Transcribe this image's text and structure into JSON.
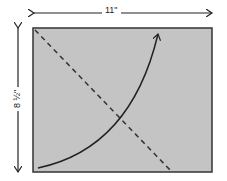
{
  "diagram": {
    "width_label": "11\"",
    "height_label": "8 ½\"",
    "sheet_fill": "#c4c4c4",
    "sheet_border": "#333333",
    "curve_arrow": "curved arrow from bottom-left corner to top edge",
    "dashed_line": "diagonal dashed line from top-left corner to bottom edge"
  }
}
